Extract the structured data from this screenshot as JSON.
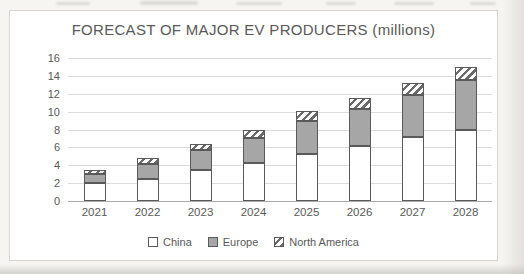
{
  "chart_data": {
    "type": "bar",
    "stacked": true,
    "title": "FORECAST OF MAJOR EV PRODUCERS (millions)",
    "categories": [
      "2021",
      "2022",
      "2023",
      "2024",
      "2025",
      "2026",
      "2027",
      "2028"
    ],
    "series": [
      {
        "name": "China",
        "fill": "#ffffff",
        "values": [
          2.0,
          2.5,
          3.5,
          4.3,
          5.3,
          6.2,
          7.2,
          8.0
        ]
      },
      {
        "name": "Europe",
        "fill": "#a6a6a6",
        "values": [
          1.0,
          1.6,
          2.2,
          2.7,
          3.6,
          4.1,
          4.7,
          5.5
        ]
      },
      {
        "name": "North America",
        "fill": "hatch",
        "values": [
          0.5,
          0.7,
          0.7,
          1.0,
          1.2,
          1.2,
          1.3,
          1.5
        ]
      }
    ],
    "totals": [
      3.5,
      4.8,
      6.4,
      8.0,
      10.1,
      11.5,
      13.2,
      15.0
    ],
    "xlabel": "",
    "ylabel": "",
    "ylim": [
      0,
      16
    ],
    "ytick_step": 2,
    "grid": true,
    "legend_position": "bottom"
  },
  "colors": {
    "text": "#595959",
    "gridline": "#dcdcdc",
    "axis_line": "#ababab",
    "bar_outline": "#5a5a5a",
    "europe_gray": "#a6a6a6",
    "card_background": "#ffffff",
    "page_background": "#f6f5f2"
  }
}
